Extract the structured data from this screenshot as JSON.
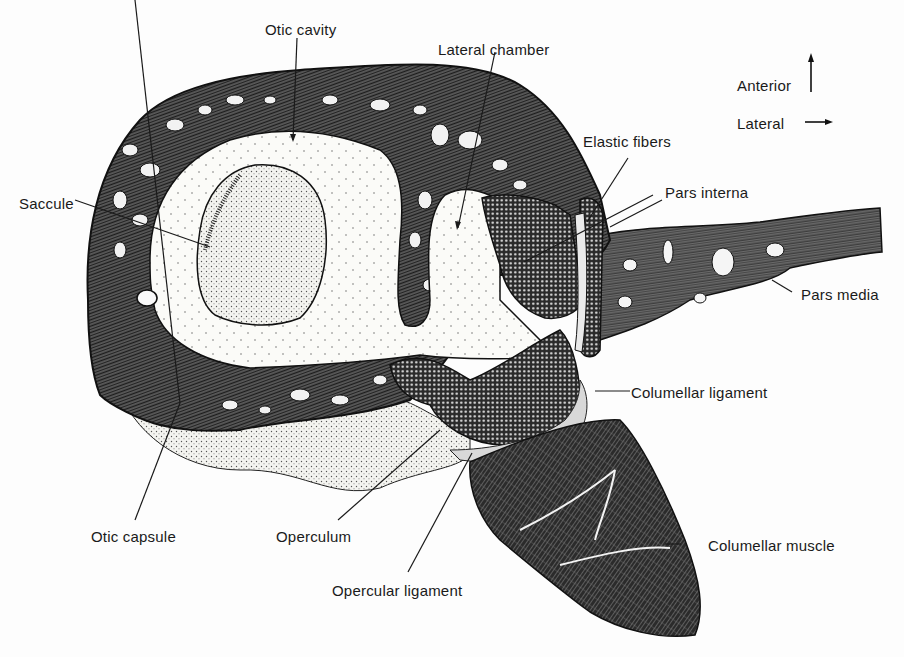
{
  "figure": {
    "type": "anatomical cross-section diagram",
    "orientation": {
      "anterior_label": "Anterior",
      "lateral_label": "Lateral",
      "anterior_arrow": "up-arrow",
      "lateral_arrow": "right-arrow"
    },
    "labels": [
      {
        "id": "otic-cavity",
        "text": "Otic cavity"
      },
      {
        "id": "lateral-chamber",
        "text": "Lateral chamber"
      },
      {
        "id": "anterior",
        "text": "Anterior"
      },
      {
        "id": "lateral",
        "text": "Lateral"
      },
      {
        "id": "elastic-fibers",
        "text": "Elastic fibers"
      },
      {
        "id": "saccule",
        "text": "Saccule"
      },
      {
        "id": "pars-interna",
        "text": "Pars interna"
      },
      {
        "id": "pars-media",
        "text": "Pars media"
      },
      {
        "id": "columellar-ligament",
        "text": "Columellar ligament"
      },
      {
        "id": "otic-capsule",
        "text": "Otic capsule"
      },
      {
        "id": "operculum",
        "text": "Operculum"
      },
      {
        "id": "columellar-muscle",
        "text": "Columellar muscle"
      },
      {
        "id": "opercular-ligament",
        "text": "Opercular ligament"
      }
    ],
    "colors": {
      "ink": "#1a1a1a",
      "background": "#fdfdfd",
      "dark_tissue": "#3a3a3a"
    }
  }
}
